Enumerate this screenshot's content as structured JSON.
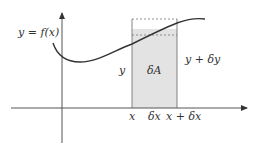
{
  "diagram": {
    "curve_label": "y = f(x)",
    "strip_left_height_label": "y",
    "strip_area_label": "δA",
    "strip_right_height_label": "y + δy",
    "x_labels": {
      "left": "x",
      "width": "δx",
      "right": "x + δx"
    },
    "colors": {
      "axis": "#555555",
      "curve": "#333333",
      "strip_fill": "#e3e3e3",
      "strip_edge": "#777777",
      "dashed": "#777777"
    }
  }
}
